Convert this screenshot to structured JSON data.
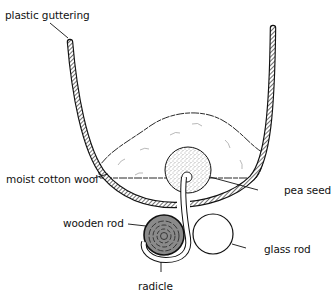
{
  "diagram": {
    "type": "labelled scientific apparatus diagram",
    "colors": {
      "ink": "#111111",
      "background": "#ffffff",
      "stipple": "#555555",
      "wood": "#777777"
    },
    "labels": [
      {
        "id": "plastic_guttering",
        "text": "plastic guttering"
      },
      {
        "id": "moist_cotton_wool",
        "text": "moist cotton wool"
      },
      {
        "id": "pea_seed",
        "text": "pea seed"
      },
      {
        "id": "wooden_rod",
        "text": "wooden rod"
      },
      {
        "id": "glass_rod",
        "text": "glass rod"
      },
      {
        "id": "radicle",
        "text": "radicle"
      }
    ]
  }
}
